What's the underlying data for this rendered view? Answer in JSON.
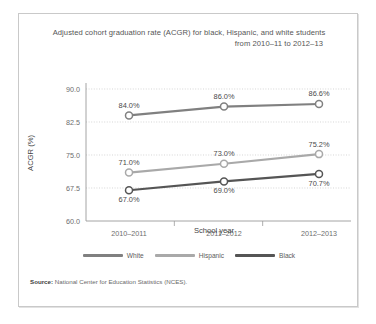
{
  "figure": {
    "title_line1": "Adjusted cohort graduation rate (ACGR) for black, Hispanic, and white students",
    "title_line2": "from 2010–11 to 2012–13",
    "source_prefix": "Source:",
    "source_text": "National Center for Education Statistics (NCES)."
  },
  "chart_data": {
    "type": "line",
    "title": "Adjusted cohort graduation rate (ACGR) for black, Hispanic, and white students from 2010–11 to 2012–13",
    "xlabel": "School year",
    "ylabel": "ACGR (%)",
    "categories": [
      "2010–2011",
      "2011–2012",
      "2012–2013"
    ],
    "ylim": [
      60.0,
      90.0
    ],
    "yticks": [
      "60.0",
      "67.5",
      "75.0",
      "82.5",
      "90.0"
    ],
    "ytick_values": [
      60.0,
      67.5,
      75.0,
      82.5,
      90.0
    ],
    "grid": true,
    "legend_position": "bottom",
    "series": [
      {
        "name": "White",
        "color": "#808080",
        "values": [
          84.0,
          86.0,
          86.6
        ],
        "labels": [
          "84.0%",
          "86.0%",
          "86.6%"
        ],
        "label_position": "above"
      },
      {
        "name": "Hispanic",
        "color": "#a9a9a9",
        "values": [
          71.0,
          73.0,
          75.2
        ],
        "labels": [
          "71.0%",
          "73.0%",
          "75.2%"
        ],
        "label_position": "above"
      },
      {
        "name": "Black",
        "color": "#555555",
        "values": [
          67.0,
          69.0,
          70.7
        ],
        "labels": [
          "67.0%",
          "69.0%",
          "70.7%"
        ],
        "label_position": "below"
      }
    ]
  },
  "legend": {
    "items": [
      {
        "label": "White",
        "color": "#808080"
      },
      {
        "label": "Hispanic",
        "color": "#a9a9a9"
      },
      {
        "label": "Black",
        "color": "#555555"
      }
    ]
  }
}
